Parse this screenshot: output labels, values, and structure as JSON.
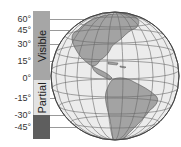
{
  "diagram": {
    "type": "globe-latitude-visibility",
    "latitude_labels": [
      {
        "label": "60°",
        "y": 15
      },
      {
        "label": "45°",
        "y": 26
      },
      {
        "label": "30°",
        "y": 40
      },
      {
        "label": "15°",
        "y": 57
      },
      {
        "label": "0°",
        "y": 74
      },
      {
        "label": "-15°",
        "y": 94
      },
      {
        "label": "-30°",
        "y": 111
      },
      {
        "label": "-45°",
        "y": 123
      }
    ],
    "segments": [
      {
        "label": "Visible",
        "top": 11,
        "bottom": 80,
        "color": "#a6a6a6"
      },
      {
        "label": "Partial",
        "top": 80,
        "bottom": 115,
        "color": "#e2e2e2"
      },
      {
        "label": "",
        "top": 115,
        "bottom": 139,
        "color": "#5e5e5e"
      }
    ],
    "globe": {
      "center_x": 115,
      "center_y": 76,
      "radius": 64,
      "ocean_color": "#ececec",
      "land_color": "#a3a3a3",
      "grid_color": "#6a6a6a"
    }
  }
}
